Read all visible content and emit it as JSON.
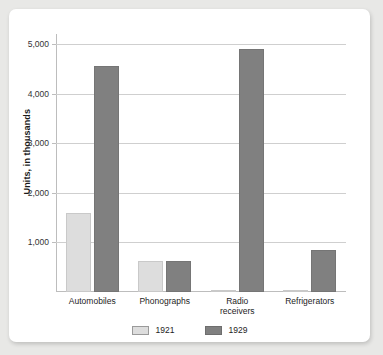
{
  "chart_data": {
    "type": "bar",
    "title": "",
    "xlabel": "",
    "ylabel": "Units, in thousands",
    "categories": [
      "Automobiles",
      "Phonographs",
      "Radio receivers",
      "Refrigerators"
    ],
    "category_lines": [
      [
        "Automobiles"
      ],
      [
        "Phonographs"
      ],
      [
        "Radio",
        "receivers"
      ],
      [
        "Refrigerators"
      ]
    ],
    "series": [
      {
        "name": "1921",
        "color": "#dddddd",
        "values": [
          1600,
          630,
          10,
          10
        ]
      },
      {
        "name": "1929",
        "color": "#808080",
        "values": [
          4550,
          630,
          4900,
          850
        ]
      }
    ],
    "ylim": [
      0,
      5200
    ],
    "yticks": [
      1000,
      2000,
      3000,
      4000,
      5000
    ],
    "ytick_labels": [
      "1,000",
      "2,000",
      "3,000",
      "4,000",
      "5,000"
    ],
    "grid": true,
    "legend_position": "bottom",
    "legend": [
      "1921",
      "1929"
    ]
  },
  "colors": {
    "page_background": "#e8e8e6",
    "card_background": "#ffffff",
    "gridline": "#cfcfcf",
    "axis": "#bdbdbd",
    "series_1921": "#dddddd",
    "series_1929": "#808080",
    "text": "#1d1d1d"
  }
}
